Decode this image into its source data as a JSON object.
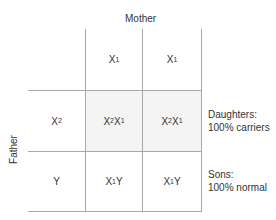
{
  "diagram": {
    "type": "punnett-square",
    "top_label": "Mother",
    "side_label": "Father",
    "mother_alleles": [
      {
        "base": "X",
        "sub": "1"
      },
      {
        "base": "X",
        "sub": "1"
      }
    ],
    "father_alleles": [
      {
        "base": "X",
        "sub": "2"
      },
      {
        "base": "Y",
        "sub": ""
      }
    ],
    "cells": [
      [
        {
          "parts": [
            {
              "base": "X",
              "sub": "2"
            },
            {
              "base": "X",
              "sub": "1"
            }
          ],
          "shaded": true
        },
        {
          "parts": [
            {
              "base": "X",
              "sub": "2"
            },
            {
              "base": "X",
              "sub": "1"
            }
          ],
          "shaded": true
        }
      ],
      [
        {
          "parts": [
            {
              "base": "X",
              "sub": "1"
            },
            {
              "base": "Y",
              "sub": ""
            }
          ],
          "shaded": false
        },
        {
          "parts": [
            {
              "base": "X",
              "sub": "1"
            },
            {
              "base": "Y",
              "sub": ""
            }
          ],
          "shaded": false
        }
      ]
    ],
    "row_notes": [
      {
        "line1": "Daughters:",
        "line2": "100% carriers"
      },
      {
        "line1": "Sons:",
        "line2": "100% normal"
      }
    ],
    "colors": {
      "grid": "#a8a8a8",
      "shade": "#f4f4f4",
      "text": "#333333"
    }
  }
}
